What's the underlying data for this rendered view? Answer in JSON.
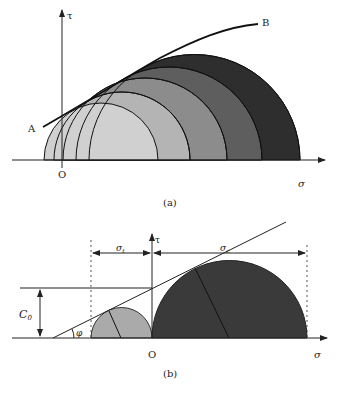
{
  "figure": {
    "panel_a": {
      "caption": "(a)",
      "axis_x_label": "σ",
      "axis_y_label": "τ",
      "origin_label": "O",
      "envelope_start_label": "A",
      "envelope_end_label": "B",
      "circle_fill_colors": [
        "#d0d0d0",
        "#b4b4b4",
        "#8c8c8c",
        "#5e5e5e",
        "#2e2e2e"
      ]
    },
    "panel_b": {
      "caption": "(b)",
      "axis_x_label": "σ",
      "axis_y_label": "τ",
      "origin_label": "O",
      "cohesion_label": "C",
      "cohesion_subscript": "0",
      "friction_angle_label": "φ",
      "tensile_label": "σ",
      "tensile_subscript": "t",
      "compressive_label": "σ",
      "compressive_subscript": "c",
      "small_circle_color": "#aaaaaa",
      "large_circle_color": "#3a3a3a"
    }
  }
}
